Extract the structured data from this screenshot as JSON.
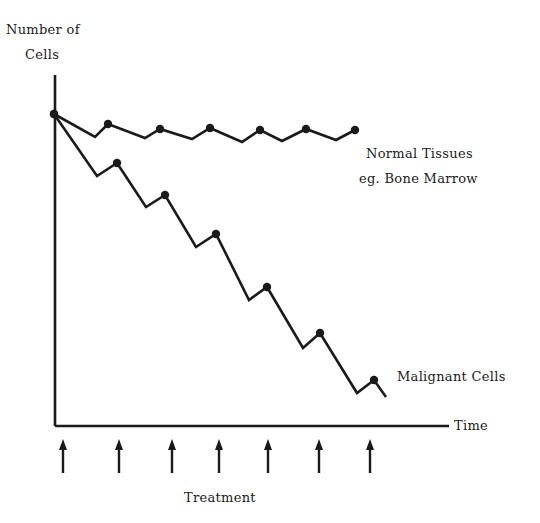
{
  "chart_data": {
    "type": "line",
    "title": "",
    "ylabel": "Number of Cells",
    "xlabel": "Time",
    "treatment_label": "Treatment",
    "grid": false,
    "legend_position": "inline-labels-right",
    "treatment_times": [
      1,
      2,
      3,
      4,
      5,
      6,
      7
    ],
    "series": [
      {
        "name": "Normal Tissues eg. Bone Marrow",
        "label_lines": [
          "Normal Tissues",
          "eg. Bone Marrow"
        ],
        "description": "Small drop after each treatment, recovers to near baseline",
        "points": [
          [
            0,
            100
          ],
          [
            0.8,
            94
          ],
          [
            1,
            97
          ],
          [
            1.8,
            93
          ],
          [
            2,
            95
          ],
          [
            2.8,
            93
          ],
          [
            3,
            96
          ],
          [
            3.8,
            92
          ],
          [
            4,
            95
          ],
          [
            4.8,
            92
          ],
          [
            5,
            95
          ],
          [
            5.8,
            93
          ],
          [
            6,
            95
          ]
        ],
        "pixel_points": [
          [
            54,
            114
          ],
          [
            95,
            137
          ],
          [
            108,
            124
          ],
          [
            145,
            138
          ],
          [
            160,
            129
          ],
          [
            192,
            139
          ],
          [
            210,
            128
          ],
          [
            242,
            142
          ],
          [
            260,
            130
          ],
          [
            282,
            141
          ],
          [
            306,
            129
          ],
          [
            336,
            140
          ],
          [
            355,
            130
          ]
        ],
        "markers_at": [
          [
            54,
            114
          ],
          [
            108,
            124
          ],
          [
            160,
            129
          ],
          [
            210,
            128
          ],
          [
            260,
            130
          ],
          [
            306,
            129
          ],
          [
            355,
            130
          ]
        ]
      },
      {
        "name": "Malignant Cells",
        "label_lines": [
          "Malignant Cells"
        ],
        "description": "Larger drop after each treatment, incomplete recovery, net decline",
        "points": [
          [
            0,
            100
          ],
          [
            0.8,
            80
          ],
          [
            1,
            84
          ],
          [
            1.8,
            70
          ],
          [
            2,
            73
          ],
          [
            2.8,
            57
          ],
          [
            3,
            61
          ],
          [
            3.8,
            40
          ],
          [
            4,
            44
          ],
          [
            4.8,
            25
          ],
          [
            5,
            29
          ],
          [
            5.8,
            11
          ],
          [
            6,
            15
          ],
          [
            6.3,
            9
          ]
        ],
        "pixel_points": [
          [
            54,
            114
          ],
          [
            97,
            176
          ],
          [
            117,
            163
          ],
          [
            146,
            207
          ],
          [
            165,
            195
          ],
          [
            196,
            247
          ],
          [
            216,
            234
          ],
          [
            249,
            300
          ],
          [
            267,
            287
          ],
          [
            303,
            348
          ],
          [
            320,
            333
          ],
          [
            357,
            393
          ],
          [
            374,
            380
          ],
          [
            386,
            397
          ]
        ],
        "markers_at": [
          [
            54,
            114
          ],
          [
            117,
            163
          ],
          [
            165,
            195
          ],
          [
            216,
            234
          ],
          [
            267,
            287
          ],
          [
            320,
            333
          ],
          [
            374,
            380
          ]
        ]
      }
    ],
    "axes": {
      "origin_px": [
        55,
        426
      ],
      "y_axis_top_px": 75,
      "x_axis_right_px": 449
    },
    "treatment_arrows_px": [
      63,
      119,
      172,
      219,
      268,
      319,
      370
    ]
  },
  "labels": {
    "y_axis_line1": "Number of",
    "y_axis_line2": "Cells",
    "x_axis": "Time",
    "normal_line1": "Normal Tissues",
    "normal_line2": "eg. Bone Marrow",
    "malignant": "Malignant Cells",
    "treatment": "Treatment"
  },
  "colors": {
    "ink": "#1a1a1a",
    "background": "#ffffff"
  }
}
